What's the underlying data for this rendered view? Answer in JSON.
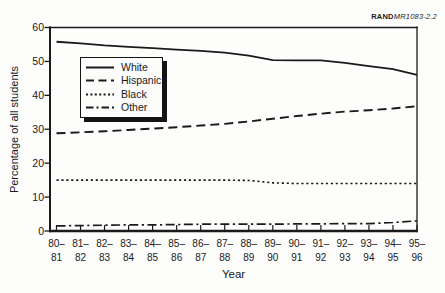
{
  "figure": {
    "source_label_bold": "RAND",
    "source_label_italic": "MR1083-2.2"
  },
  "chart_data": {
    "type": "line",
    "title": "",
    "xlabel": "Year",
    "ylabel": "Percentage of all students",
    "ylim": [
      0,
      60
    ],
    "yticks": [
      0,
      10,
      20,
      30,
      40,
      50,
      60
    ],
    "grid": false,
    "legend_position": "upper-left-inside",
    "line_color": "#1a1a1a",
    "categories": [
      "80–81",
      "81–82",
      "82–83",
      "83–84",
      "84–85",
      "85–86",
      "86–87",
      "87–88",
      "88–89",
      "89–90",
      "90–91",
      "91–92",
      "92–93",
      "93–94",
      "94–95",
      "95–96"
    ],
    "series": [
      {
        "name": "White",
        "style": "solid",
        "values": [
          55.8,
          55.3,
          54.7,
          54.3,
          53.9,
          53.5,
          53.1,
          52.6,
          51.7,
          50.4,
          50.3,
          50.3,
          49.6,
          48.6,
          47.7,
          46.0
        ]
      },
      {
        "name": "Hispanic",
        "style": "dashed",
        "values": [
          28.8,
          29.1,
          29.4,
          29.8,
          30.2,
          30.6,
          31.1,
          31.6,
          32.3,
          33.1,
          33.9,
          34.6,
          35.2,
          35.6,
          36.1,
          36.8
        ]
      },
      {
        "name": "Black",
        "style": "dotted",
        "values": [
          15.0,
          15.0,
          15.0,
          15.0,
          15.0,
          15.0,
          15.0,
          15.0,
          14.9,
          14.2,
          14.0,
          14.0,
          14.0,
          14.0,
          14.0,
          14.0
        ]
      },
      {
        "name": "Other",
        "style": "dashdot",
        "values": [
          1.5,
          1.6,
          1.7,
          1.8,
          1.8,
          1.9,
          2.0,
          2.0,
          2.0,
          2.0,
          2.1,
          2.1,
          2.2,
          2.2,
          2.5,
          3.0
        ]
      }
    ]
  }
}
